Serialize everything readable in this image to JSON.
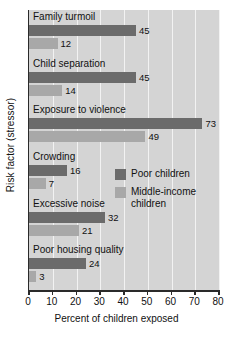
{
  "chart_data": {
    "type": "bar",
    "orientation": "horizontal",
    "title": "",
    "xlabel": "Percent of children exposed",
    "ylabel": "Risk factor (stressor)",
    "xlim": [
      0,
      80
    ],
    "xticks": [
      0,
      10,
      20,
      30,
      40,
      50,
      60,
      70,
      80
    ],
    "grid": true,
    "legend_position": "inside-right",
    "categories": [
      "Family turmoil",
      "Child separation",
      "Exposure to violence",
      "Crowding",
      "Excessive noise",
      "Poor housing quality"
    ],
    "series": [
      {
        "name": "Poor children",
        "color": "#6b6b6b",
        "values": [
          45,
          45,
          73,
          16,
          32,
          24
        ]
      },
      {
        "name": "Middle-income children",
        "color": "#a8a8a8",
        "values": [
          12,
          14,
          49,
          7,
          21,
          3
        ]
      }
    ],
    "value_labels": {
      "poor": [
        "45",
        "45",
        "73",
        "16",
        "32",
        "24"
      ],
      "middle": [
        "12",
        "14",
        "49",
        "7",
        "21",
        "3"
      ]
    },
    "legend": [
      {
        "label": "Poor children",
        "color": "#6b6b6b"
      },
      {
        "label": "Middle-income children",
        "color": "#a8a8a8"
      }
    ],
    "colors": {
      "plot_background": "#d4d4d4",
      "gridline": "#f2f2f2",
      "axis": "#2a2a2a",
      "page_background": "#ffffff",
      "text": "#111111"
    }
  }
}
